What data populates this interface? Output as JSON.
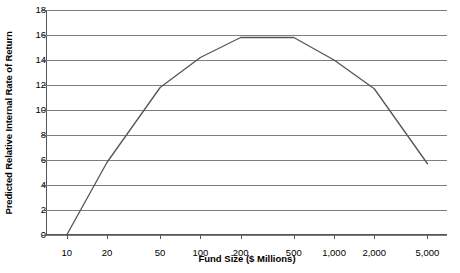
{
  "chart_data": {
    "type": "line",
    "title": "",
    "xlabel": "Fund Size ($ Millions)",
    "ylabel": "Predicted Relative Internal Rate of Return",
    "xscale": "log",
    "xlim": [
      7,
      7000
    ],
    "ylim": [
      0,
      18
    ],
    "grid": true,
    "legend": false,
    "xticks": [
      10,
      20,
      50,
      100,
      200,
      500,
      1000,
      2000,
      5000
    ],
    "xtick_labels": [
      "10",
      "20",
      "50",
      "100",
      "200",
      "500",
      "1,000",
      "2,000",
      "5,000"
    ],
    "yticks": [
      0,
      2,
      4,
      6,
      8,
      10,
      12,
      14,
      16,
      18
    ],
    "ytick_labels": [
      "0",
      "2",
      "4",
      "6",
      "8",
      "10",
      "12",
      "14",
      "16",
      "18"
    ],
    "series": [
      {
        "name": "Predicted Relative IRR",
        "color": "#555555",
        "x": [
          10,
          20,
          50,
          100,
          200,
          500,
          1000,
          2000,
          5000
        ],
        "values": [
          0.0,
          5.8,
          11.8,
          14.2,
          15.8,
          15.8,
          14.0,
          11.7,
          5.7
        ]
      }
    ]
  },
  "axes": {
    "x_title": "Fund Size ($ Millions)",
    "y_title": "Predicted Relative Internal Rate of Return"
  }
}
